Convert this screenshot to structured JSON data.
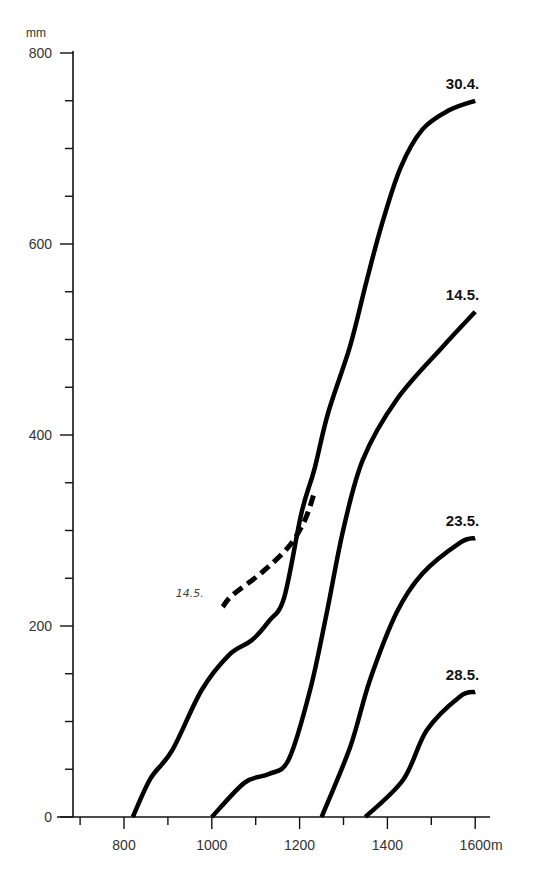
{
  "chart_data": {
    "type": "line",
    "title": "",
    "xlabel": "m",
    "ylabel": "mm",
    "xlim": [
      700,
      1600
    ],
    "ylim": [
      0,
      800
    ],
    "x_major_ticks": [
      800,
      1000,
      1200,
      1400,
      1600
    ],
    "x_minor_ticks": [
      700,
      900,
      1100,
      1300,
      1500
    ],
    "y_major_ticks": [
      0,
      200,
      400,
      600,
      800
    ],
    "y_minor_ticks": [
      50,
      100,
      150,
      250,
      300,
      350,
      450,
      500,
      550,
      650,
      700,
      750
    ],
    "x_tick_labels": [
      "800",
      "1000",
      "1200",
      "1400",
      "1600"
    ],
    "y_tick_labels": [
      "0",
      "200",
      "400",
      "600",
      "800"
    ],
    "grid": false,
    "legend": "inline labels at curve ends (right)",
    "series": [
      {
        "name": "30.4.",
        "style": "solid",
        "points": [
          [
            820,
            0
          ],
          [
            860,
            40
          ],
          [
            910,
            70
          ],
          [
            977,
            133
          ],
          [
            1040,
            170
          ],
          [
            1091,
            185
          ],
          [
            1130,
            205
          ],
          [
            1165,
            230
          ],
          [
            1204,
            318
          ],
          [
            1233,
            363
          ],
          [
            1265,
            423
          ],
          [
            1315,
            493
          ],
          [
            1353,
            562
          ],
          [
            1387,
            620
          ],
          [
            1430,
            680
          ],
          [
            1480,
            720
          ],
          [
            1540,
            740
          ],
          [
            1600,
            750
          ]
        ]
      },
      {
        "name": "14.5.",
        "style": "solid",
        "points": [
          [
            1000,
            0
          ],
          [
            1075,
            36
          ],
          [
            1130,
            45
          ],
          [
            1175,
            60
          ],
          [
            1224,
            133
          ],
          [
            1262,
            214
          ],
          [
            1299,
            300
          ],
          [
            1344,
            374
          ],
          [
            1421,
            437
          ],
          [
            1527,
            493
          ],
          [
            1600,
            529
          ]
        ]
      },
      {
        "name": "23.5.",
        "style": "solid",
        "points": [
          [
            1250,
            0
          ],
          [
            1315,
            73
          ],
          [
            1360,
            143
          ],
          [
            1421,
            214
          ],
          [
            1480,
            255
          ],
          [
            1565,
            287
          ],
          [
            1600,
            292
          ]
        ]
      },
      {
        "name": "28.5.",
        "style": "solid",
        "points": [
          [
            1350,
            0
          ],
          [
            1436,
            39
          ],
          [
            1490,
            91
          ],
          [
            1565,
            126
          ],
          [
            1600,
            131
          ]
        ]
      },
      {
        "name": "14.5.",
        "style": "dashed",
        "points": [
          [
            1025,
            220
          ],
          [
            1046,
            232
          ],
          [
            1114,
            256
          ],
          [
            1175,
            283
          ],
          [
            1212,
            311
          ],
          [
            1235,
            342
          ]
        ]
      }
    ]
  }
}
